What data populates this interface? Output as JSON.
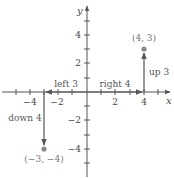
{
  "diagram": {
    "type": "coordinate-plane-translation",
    "origin_px": [
      87,
      92
    ],
    "unit_px": 14.3,
    "axes": {
      "x": {
        "label": "x",
        "min": -5,
        "max": 5.5
      },
      "y": {
        "label": "y",
        "min": -6,
        "max": 5.8
      }
    },
    "x_tick_labels": [
      {
        "value": -4,
        "text": "−4"
      },
      {
        "value": -2,
        "text": "−2"
      },
      {
        "value": 2,
        "text": "2"
      },
      {
        "value": 4,
        "text": "4"
      }
    ],
    "y_tick_labels": [
      {
        "value": 4,
        "text": "4"
      },
      {
        "value": 2,
        "text": "2"
      },
      {
        "value": -2,
        "text": "−2"
      },
      {
        "value": -4,
        "text": "−4"
      }
    ],
    "points": [
      {
        "x": 4,
        "y": 3,
        "label": "(4, 3)",
        "color": "#888888"
      },
      {
        "x": -3,
        "y": -4,
        "label": "(−3, −4)",
        "color": "#888888"
      }
    ],
    "movements": [
      {
        "from": [
          0,
          0
        ],
        "to": [
          4,
          0
        ],
        "label": "right 4"
      },
      {
        "from": [
          4,
          0
        ],
        "to": [
          4,
          3
        ],
        "label": "up 3"
      },
      {
        "from": [
          0,
          0
        ],
        "to": [
          -3,
          0
        ],
        "label": "left 3"
      },
      {
        "from": [
          -3,
          0
        ],
        "to": [
          -3,
          -4
        ],
        "label": "down 4"
      }
    ],
    "colors": {
      "axis": "#555555",
      "point": "#888888",
      "label": "#777777"
    }
  }
}
